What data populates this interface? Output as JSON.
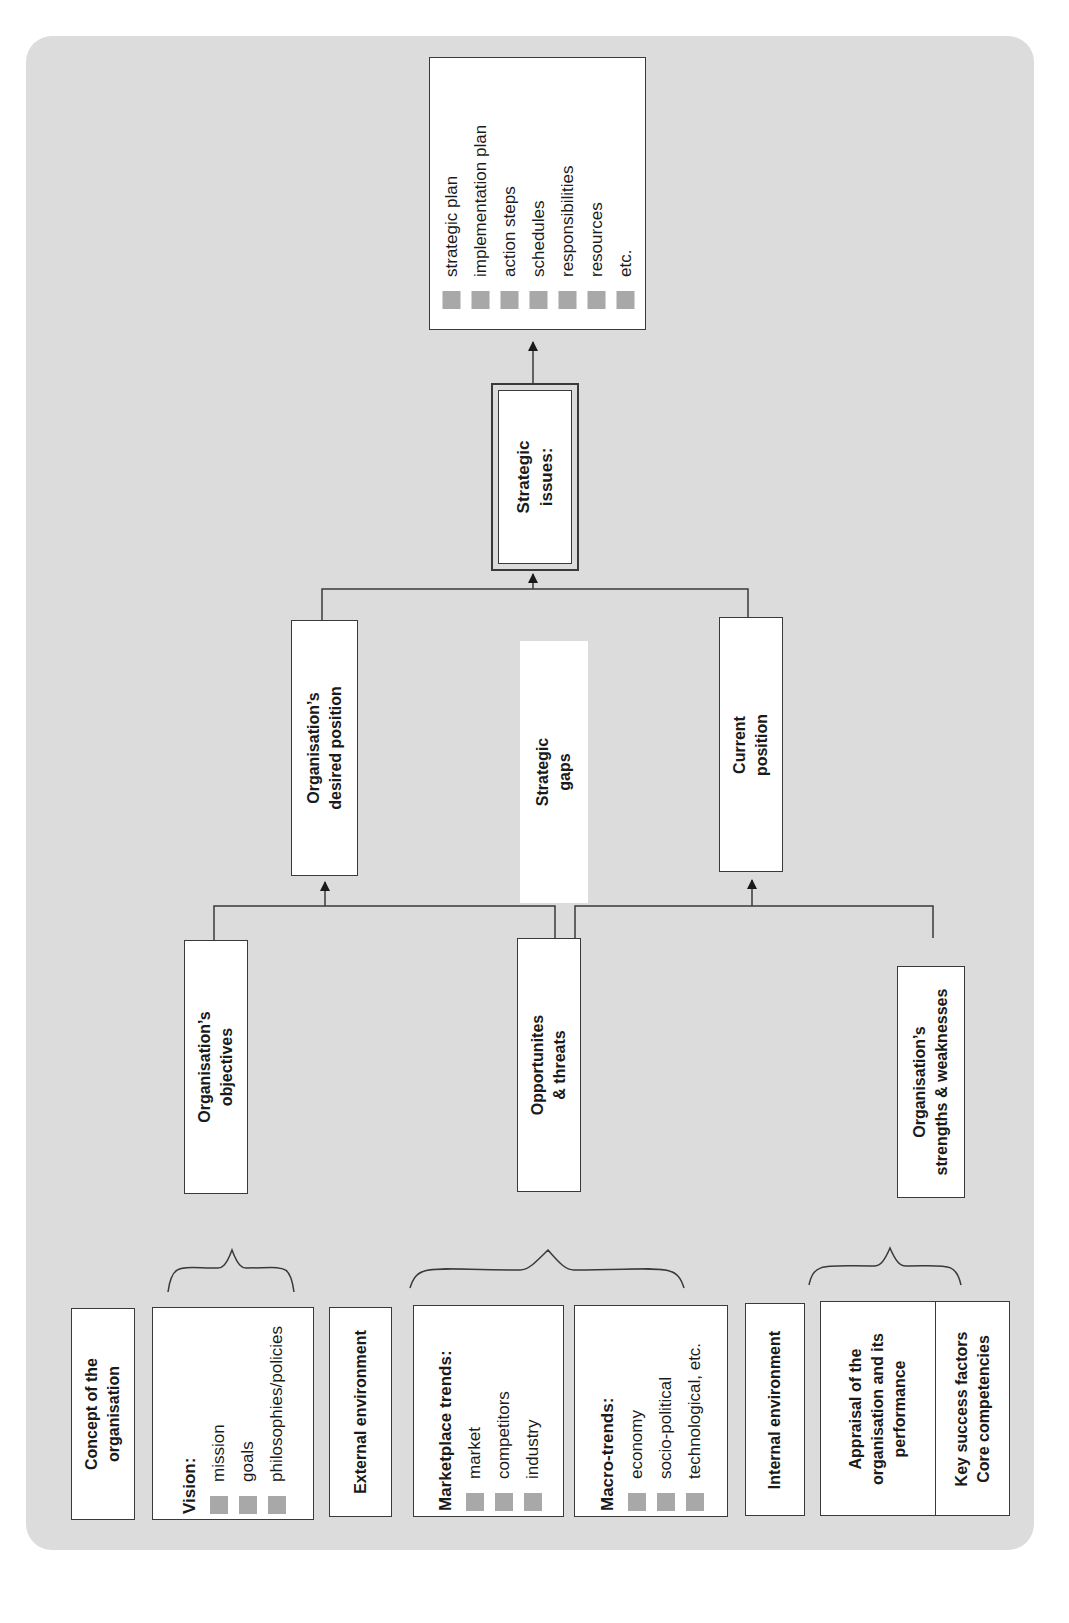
{
  "diagram": {
    "orientation": "rotated-90-ccw",
    "colors": {
      "panel_bg": "#dcdcdc",
      "box_bg": "#ffffff",
      "line": "#3a3a3a",
      "bullet": "#a8a8a8"
    },
    "outcome": {
      "items": [
        "strategic plan",
        "implementation plan",
        "action steps",
        "schedules",
        "responsibilities",
        "resources",
        "etc."
      ]
    },
    "strategic_issues": {
      "line1": "Strategic",
      "line2": "issues:"
    },
    "desired_position": {
      "line1": "Organisation’s",
      "line2": "desired position"
    },
    "strategic_gaps": {
      "line1": "Strategic",
      "line2": "gaps"
    },
    "current_position": {
      "line1": "Current",
      "line2": "position"
    },
    "objectives": {
      "line1": "Organisation’s",
      "line2": "objectives"
    },
    "opportunities": {
      "line1": "Opportunites",
      "line2": "& threats"
    },
    "strengths": {
      "line1": "Organisation’s",
      "line2": "strengths & weaknesses"
    },
    "concept": {
      "line1": "Concept of the",
      "line2": "organisation"
    },
    "vision": {
      "heading": "Vision:",
      "items": [
        "mission",
        "goals",
        "philosophies/policies"
      ]
    },
    "external_env": {
      "label": "External environment"
    },
    "marketplace": {
      "heading": "Marketplace trends:",
      "items": [
        "market",
        "competitors",
        "industry"
      ]
    },
    "macro": {
      "heading": "Macro-trends:",
      "items": [
        "economy",
        "socio-political",
        "technological, etc."
      ]
    },
    "internal_env": {
      "label": "Internal environment"
    },
    "appraisal": {
      "line1": "Appraisal of the",
      "line2": "organisation and its",
      "line3": "performance"
    },
    "ksf": {
      "line1": "Key success factors",
      "line2": "Core competencies"
    }
  }
}
